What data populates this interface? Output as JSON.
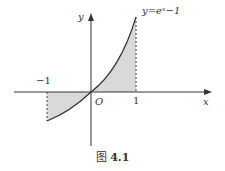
{
  "figure": {
    "curve_label": "y=eˣ−1",
    "x_axis_label": "x",
    "y_axis_label": "y",
    "origin_label": "O",
    "tick_neg1": "−1",
    "tick_1": "1",
    "caption_prefix": "图",
    "caption_number": "4.1"
  },
  "colors": {
    "axis": "#333333",
    "curve": "#333333",
    "shade": "#d9d9d9",
    "dashed": "#444444"
  }
}
